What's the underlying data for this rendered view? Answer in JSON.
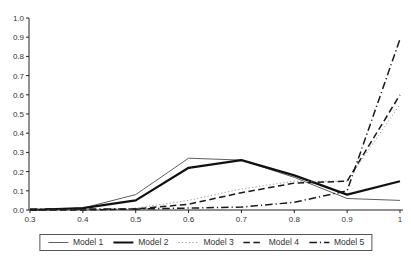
{
  "chart_data": {
    "type": "line",
    "title": "",
    "xlabel": "",
    "ylabel": "",
    "xlim": [
      0.3,
      1.0
    ],
    "ylim": [
      0.0,
      1.0
    ],
    "grid": false,
    "legend_position": "bottom",
    "x": [
      0.3,
      0.4,
      0.5,
      0.6,
      0.7,
      0.8,
      0.9,
      1.0
    ],
    "x_ticks": [
      "0.3",
      "0.4",
      "0.5",
      "0.6",
      "0.7",
      "0.8",
      "0.9",
      "1"
    ],
    "y_ticks": [
      "0.0",
      "0.1",
      "0.2",
      "0.3",
      "0.4",
      "0.5",
      "0.6",
      "0.7",
      "0.8",
      "0.9",
      "1.0"
    ],
    "series": [
      {
        "name": "Model 1",
        "style": "solid",
        "weight": "thin",
        "color": "#5f5f5f",
        "values": [
          0.0,
          0.01,
          0.08,
          0.27,
          0.26,
          0.17,
          0.06,
          0.05
        ]
      },
      {
        "name": "Model 2",
        "style": "solid",
        "weight": "thick",
        "color": "#111111",
        "values": [
          0.0,
          0.01,
          0.05,
          0.22,
          0.26,
          0.18,
          0.08,
          0.15
        ]
      },
      {
        "name": "Model 3",
        "style": "dotted",
        "weight": "thin",
        "color": "#9e9e9e",
        "values": [
          0.0,
          0.0,
          0.01,
          0.05,
          0.11,
          0.15,
          0.15,
          0.55
        ]
      },
      {
        "name": "Model 4",
        "style": "dashed",
        "weight": "medium",
        "color": "#1a1a1a",
        "values": [
          0.0,
          0.0,
          0.005,
          0.03,
          0.09,
          0.14,
          0.15,
          0.6
        ]
      },
      {
        "name": "Model 5",
        "style": "dash-dot",
        "weight": "medium",
        "color": "#1a1a1a",
        "values": [
          0.005,
          0.005,
          0.005,
          0.01,
          0.015,
          0.04,
          0.1,
          0.89
        ]
      }
    ]
  },
  "colors": {
    "background": "#ffffff",
    "axis": "#222222",
    "tick_text": "#333333",
    "legend_border": "#555555"
  }
}
